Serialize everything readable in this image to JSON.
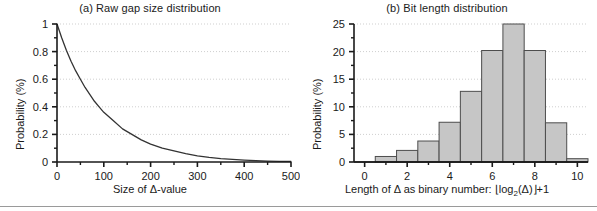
{
  "figure": {
    "background": "#ffffff",
    "axis_color": "#1a1a1a",
    "grid_color": "#cfcfcf",
    "bar_fill": "#c6c6c6",
    "bar_edge": "#4d4d4d",
    "curve_color": "#333333"
  },
  "panel_a": {
    "title": "(a) Raw gap size distribution",
    "ylabel": "Probability (%)",
    "xlabel_prefix": "Size of ",
    "xlabel_symbol": "Δ",
    "xlabel_suffix": "-value",
    "xlabel_full": "Size of Δ-value",
    "xticks": [
      "0",
      "100",
      "200",
      "300",
      "400",
      "500"
    ],
    "yticks": [
      "0",
      "0.2",
      "0.4",
      "0.6",
      "0.8",
      "1"
    ]
  },
  "panel_b": {
    "title": "(b) Bit length distribution",
    "ylabel": "Probability (%)",
    "xlabel_prefix": "Length of ",
    "xlabel_symbol": "Δ",
    "xlabel_mid": " as binary number:  ",
    "xlabel_floor_open": "⌊",
    "xlabel_log": "log",
    "xlabel_log_sub": "2",
    "xlabel_arg": "(Δ)",
    "xlabel_floor_close": "⌋",
    "xlabel_plus": "+1",
    "xlabel_full": "Length of Δ as binary number:  ⌊log2(Δ)⌋ +1",
    "xticks": [
      "0",
      "2",
      "4",
      "6",
      "8",
      "10"
    ],
    "yticks": [
      "0",
      "5",
      "10",
      "15",
      "20",
      "25"
    ]
  },
  "chart_data": [
    {
      "type": "line",
      "title": "(a) Raw gap size distribution",
      "xlabel": "Size of Δ-value",
      "ylabel": "Probability (%)",
      "xlim": [
        0,
        500
      ],
      "ylim": [
        0,
        1
      ],
      "xticks": [
        0,
        100,
        200,
        300,
        400,
        500
      ],
      "yticks": [
        0,
        0.2,
        0.4,
        0.6,
        0.8,
        1
      ],
      "grid": true,
      "legend": "none",
      "description": "Exponentially decaying probability of raw gap size",
      "x": [
        0,
        10,
        20,
        30,
        40,
        50,
        60,
        70,
        80,
        90,
        100,
        120,
        140,
        160,
        180,
        200,
        225,
        250,
        275,
        300,
        325,
        350,
        375,
        400,
        425,
        450,
        475,
        500
      ],
      "y": [
        1.0,
        0.9,
        0.81,
        0.73,
        0.66,
        0.6,
        0.54,
        0.49,
        0.44,
        0.4,
        0.36,
        0.3,
        0.24,
        0.2,
        0.16,
        0.13,
        0.1,
        0.08,
        0.06,
        0.045,
        0.034,
        0.025,
        0.019,
        0.014,
        0.01,
        0.007,
        0.005,
        0.004
      ]
    },
    {
      "type": "bar",
      "title": "(b) Bit length distribution",
      "xlabel": "Length of Δ as binary number:  ⌊log2(Δ)⌋ +1",
      "ylabel": "Probability (%)",
      "xlim": [
        -0.5,
        10.5
      ],
      "ylim": [
        0,
        25
      ],
      "xticks": [
        0,
        2,
        4,
        6,
        8,
        10
      ],
      "yticks": [
        0,
        5,
        10,
        15,
        20,
        25
      ],
      "grid": true,
      "legend": "none",
      "categories": [
        1,
        2,
        3,
        4,
        5,
        6,
        7,
        8,
        9,
        10
      ],
      "values": [
        1.0,
        2.1,
        3.8,
        7.2,
        12.8,
        20.2,
        25.0,
        20.2,
        7.1,
        0.6
      ]
    }
  ]
}
